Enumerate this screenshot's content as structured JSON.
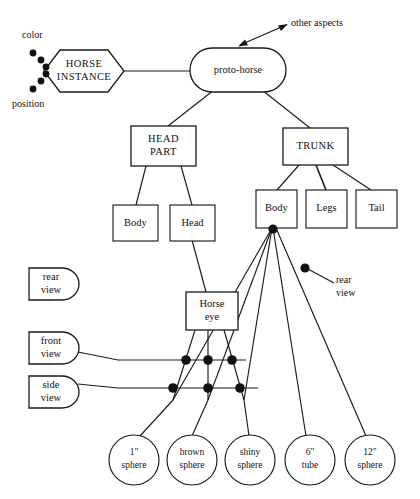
{
  "diagram": {
    "colors": {
      "stroke": "#1a1a1a",
      "fill": "#ffffff",
      "text": "#111111",
      "dot": "#111111"
    },
    "nodes": {
      "horse_instance": "HORSE\nINSTANCE",
      "horse_instance_line1": "HORSE",
      "horse_instance_line2": "INSTANCE",
      "proto_horse": "proto-horse",
      "head_part_line1": "HEAD",
      "head_part_line2": "PART",
      "trunk": "TRUNK",
      "head_body": "Body",
      "head_head": "Head",
      "trunk_body": "Body",
      "trunk_legs": "Legs",
      "trunk_tail": "Tail",
      "horse_eye_line1": "Horse",
      "horse_eye_line2": "eye",
      "rear_view_line1": "rear",
      "rear_view_line2": "view",
      "front_view_line1": "front",
      "front_view_line2": "view",
      "side_view_line1": "side",
      "side_view_line2": "view",
      "sphere1_line1": "1″",
      "sphere1_line2": "sphere",
      "brown_line1": "brown",
      "brown_line2": "sphere",
      "shiny_line1": "shiny",
      "shiny_line2": "sphere",
      "tube_line1": "6″",
      "tube_line2": "tube",
      "sphere12_line1": "12″",
      "sphere12_line2": "sphere"
    },
    "annotations": {
      "color": "color",
      "position": "position",
      "other_aspects": "other aspects",
      "rear_view_right_line1": "rear",
      "rear_view_right_line2": "view"
    }
  }
}
